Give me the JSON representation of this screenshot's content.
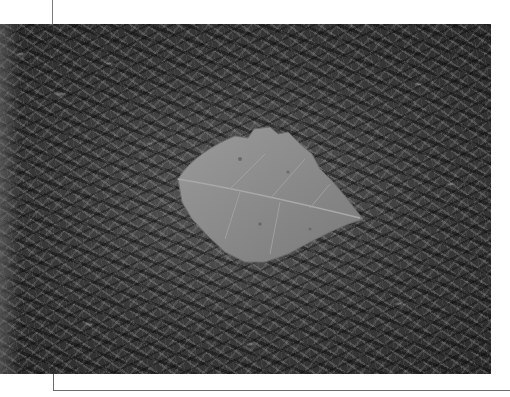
{
  "image": {
    "subject": "leaf-on-moss",
    "description": "Grayscale photograph of a single dry leaf resting on a bed of spiky moss",
    "palette": {
      "background": "#ffffff",
      "moss_dark": "#2a2a2a",
      "moss_light": "#c8c8c8",
      "leaf": "#8c8c8c",
      "crop_marks": "#6a6a6a"
    }
  },
  "crop_marks": {
    "top_vertical": {
      "x": 52,
      "y1": 0,
      "y2": 24
    },
    "bottom_corner": {
      "x": 53,
      "y1": 374,
      "y2": 390,
      "x2": 510
    }
  }
}
